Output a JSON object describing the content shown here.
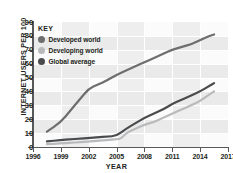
{
  "chart_data": {
    "type": "line",
    "title": "",
    "xlabel": "YEAR",
    "ylabel": "INTERNET USERS PER 100",
    "xlim": [
      1996,
      2017
    ],
    "ylim": [
      0,
      90
    ],
    "xticks": [
      "1996",
      "1999",
      "2002",
      "2005",
      "2008",
      "2011",
      "2014",
      "2017"
    ],
    "yticks": [
      "0",
      "10",
      "20",
      "30",
      "40",
      "50",
      "60",
      "70",
      "80",
      "90"
    ],
    "grid": true,
    "legend_position": "top-left",
    "legend_title": "KEY",
    "series": [
      {
        "name": "Developed world",
        "color": "#6d6e70",
        "x": [
          1997.5,
          1999,
          2000,
          2001,
          2002,
          2003,
          2004,
          2005,
          2006,
          2007,
          2008,
          2009,
          2010,
          2011,
          2012,
          2013,
          2014,
          2015,
          2015.5
        ],
        "values": [
          11,
          18,
          26,
          34,
          42,
          45,
          48,
          52,
          55,
          58,
          61,
          64,
          67,
          70,
          72,
          74,
          77,
          80,
          81
        ]
      },
      {
        "name": "Developing world",
        "color": "#b9babc",
        "x": [
          1997.5,
          1999,
          2000,
          2001,
          2002,
          2003,
          2004,
          2005,
          2005.5,
          2006,
          2007,
          2008,
          2009,
          2010,
          2011,
          2012,
          2013,
          2014,
          2015,
          2015.5
        ],
        "values": [
          2,
          2.5,
          3,
          3.5,
          4,
          4.5,
          5,
          5.5,
          6,
          10,
          13,
          16,
          18,
          21,
          24,
          27,
          30,
          33,
          38,
          40
        ]
      },
      {
        "name": "Global average",
        "color": "#4a4b4d",
        "x": [
          1997.5,
          1999,
          2000,
          2001,
          2002,
          2003,
          2004,
          2005,
          2006,
          2007,
          2008,
          2009,
          2010,
          2011,
          2012,
          2013,
          2014,
          2015,
          2015.5
        ],
        "values": [
          4,
          5,
          5.5,
          6,
          6.5,
          7,
          7.5,
          8,
          13,
          17,
          21,
          24,
          27,
          31,
          34,
          37,
          40,
          44,
          46
        ]
      }
    ]
  },
  "legend": {
    "title": "KEY",
    "items": [
      {
        "label": "Developed world",
        "color": "#6d6e70"
      },
      {
        "label": "Developing world",
        "color": "#b9babc"
      },
      {
        "label": "Global average",
        "color": "#4a4b4d"
      }
    ]
  },
  "axes": {
    "y_title": "INTERNET USERS PER 100",
    "x_title": "YEAR",
    "y_ticks": [
      "90",
      "80",
      "70",
      "60",
      "50",
      "40",
      "30",
      "20",
      "10",
      "0"
    ],
    "x_ticks": [
      "1996",
      "1999",
      "2002",
      "2005",
      "2008",
      "2011",
      "2014",
      "2017"
    ]
  },
  "colors": {
    "axis": "#58595b",
    "text": "#231f20",
    "plot_background": "#fbfbfb",
    "band": "#ededed",
    "gridline": "#ffffff"
  }
}
